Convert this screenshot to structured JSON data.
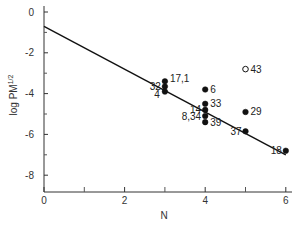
{
  "chart_data": {
    "type": "scatter",
    "title": "",
    "xlabel": "N",
    "ylabel": "log PM",
    "ylabel_superscript": "1/2",
    "xlim": [
      0,
      6
    ],
    "ylim": [
      -9,
      0
    ],
    "xticks": [
      0,
      2,
      4,
      6
    ],
    "xticks_minor": [
      1,
      3,
      5
    ],
    "yticks": [
      0,
      -2,
      -4,
      -6,
      -8
    ],
    "yticks_minor": [
      -1,
      -3,
      -5,
      -7
    ],
    "grid": false,
    "legend": null,
    "fit_line": {
      "x": [
        0,
        6
      ],
      "y": [
        -0.7,
        -7.0
      ]
    },
    "points": [
      {
        "label": "17,1",
        "x": 3,
        "y": -3.4,
        "filled": true,
        "label_side": "right"
      },
      {
        "label": "32",
        "x": 3,
        "y": -3.65,
        "filled": true,
        "label_side": "left"
      },
      {
        "label": "4",
        "x": 3,
        "y": -3.9,
        "filled": true,
        "label_side": "below-left"
      },
      {
        "label": "6",
        "x": 4,
        "y": -3.8,
        "filled": true,
        "label_side": "right"
      },
      {
        "label": "33",
        "x": 4,
        "y": -4.5,
        "filled": true,
        "label_side": "right"
      },
      {
        "label": "14",
        "x": 4,
        "y": -4.8,
        "filled": true,
        "label_side": "left"
      },
      {
        "label": "8,34",
        "x": 4,
        "y": -5.1,
        "filled": true,
        "label_side": "left"
      },
      {
        "label": "39",
        "x": 4,
        "y": -5.4,
        "filled": true,
        "label_side": "right"
      },
      {
        "label": "43",
        "x": 5,
        "y": -2.8,
        "filled": false,
        "label_side": "right"
      },
      {
        "label": "29",
        "x": 5,
        "y": -4.9,
        "filled": true,
        "label_side": "right"
      },
      {
        "label": "37",
        "x": 5,
        "y": -5.85,
        "filled": true,
        "label_side": "left"
      },
      {
        "label": "18",
        "x": 6,
        "y": -6.8,
        "filled": true,
        "label_side": "left"
      }
    ]
  }
}
